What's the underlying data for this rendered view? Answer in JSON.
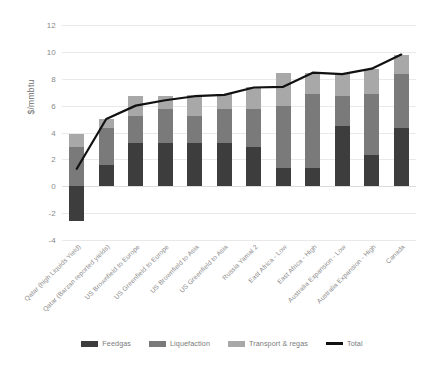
{
  "chart_data": {
    "type": "bar",
    "subtype": "stacked-bar-with-line",
    "title": "",
    "xlabel": "",
    "ylabel": "$/mmbtu",
    "ylim": [
      -4,
      12
    ],
    "yticks": [
      12,
      10,
      8,
      6,
      4,
      2,
      0,
      -2,
      -4
    ],
    "grid": true,
    "legend_position": "bottom",
    "categories": [
      "Qatar (high Liquids Yield)",
      "Qatar (Barzan reported yields)",
      "US Brownfield to Europe",
      "US Greenfield to Europe",
      "US Brownfield to Asia",
      "US Greenfield to Asia",
      "Russia Yamal 2",
      "East Africa - Low",
      "East Africa - High",
      "Australia Expansion - Low",
      "Australia Expansion - High",
      "Canada"
    ],
    "series": [
      {
        "name": "Feedgas",
        "color": "#3d3d3d",
        "values": [
          -2.6,
          1.6,
          3.25,
          3.25,
          3.25,
          3.25,
          2.95,
          1.35,
          1.35,
          4.5,
          2.3,
          4.35
        ]
      },
      {
        "name": "Liquefaction",
        "color": "#7a7a7a",
        "values": [
          2.9,
          2.75,
          2.0,
          2.5,
          2.0,
          2.5,
          2.8,
          4.6,
          5.55,
          2.25,
          4.55,
          4.0
        ]
      },
      {
        "name": "Transport & regas",
        "color": "#a8a8a8",
        "values": [
          1.0,
          0.65,
          1.45,
          1.0,
          1.55,
          1.1,
          1.6,
          2.45,
          1.55,
          1.6,
          1.9,
          1.45
        ]
      }
    ],
    "line_series": {
      "name": "Total",
      "color": "#111111",
      "values": [
        1.3,
        5.0,
        6.0,
        6.4,
        6.7,
        6.8,
        7.35,
        7.4,
        8.45,
        8.35,
        8.75,
        9.8
      ]
    }
  },
  "legend": {
    "items": [
      {
        "label": "Feedgas",
        "color": "#3d3d3d",
        "kind": "swatch"
      },
      {
        "label": "Liquefaction",
        "color": "#7a7a7a",
        "kind": "swatch"
      },
      {
        "label": "Transport & regas",
        "color": "#a8a8a8",
        "kind": "swatch"
      },
      {
        "label": "Total",
        "color": "#111111",
        "kind": "line"
      }
    ]
  },
  "axis": {
    "y_title": "$/mmbtu",
    "y_tick_labels": [
      "12",
      "10",
      "8",
      "6",
      "4",
      "2",
      "0",
      "-2",
      "-4"
    ]
  }
}
